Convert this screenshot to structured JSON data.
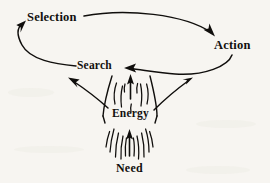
{
  "figure": {
    "background_color": "#f7f5f1",
    "ink_color": "#100e0c",
    "width": 270,
    "height": 183,
    "nodes": {
      "selection": "Selection",
      "action": "Action",
      "search": "Search",
      "energy": "Energy",
      "need": "Need"
    },
    "icons": {
      "cycle_arc_top": "arc-arrow-selection-to-action",
      "cycle_arc_bottom": "arc-arrow-action-to-search",
      "cycle_arc_left": "arc-arrow-search-to-selection",
      "funnel": "energy-funnel",
      "arrow_up_energy": "up-arrow-energy-to-search",
      "arrow_up_need": "up-arrow-need-to-energy",
      "arrow_left_branch": "branch-arrow-to-selection",
      "arrow_right_branch": "branch-arrow-to-action"
    }
  }
}
